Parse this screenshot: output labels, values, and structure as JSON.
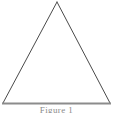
{
  "figure": {
    "background_color": "#ffffff",
    "width": 113,
    "height": 113,
    "caption": {
      "text": "Figure 1",
      "visible_portion": "clipped-letter-tops",
      "color": "#8a8a8a"
    },
    "shape": {
      "kind": "triangle",
      "style": "outline",
      "fill": "none",
      "stroke_color": "#4a4a4a",
      "stroke_width": 1,
      "vertices": {
        "apex": {
          "x": 57,
          "y": 2
        },
        "base_left": {
          "x": 3,
          "y": 103
        },
        "base_right": {
          "x": 110,
          "y": 103
        }
      }
    },
    "base_line": {
      "name": "triangle-base",
      "color": "#8c8c8c",
      "stroke_width": 2,
      "x_start": 2,
      "x_end": 111,
      "y": 103
    }
  }
}
